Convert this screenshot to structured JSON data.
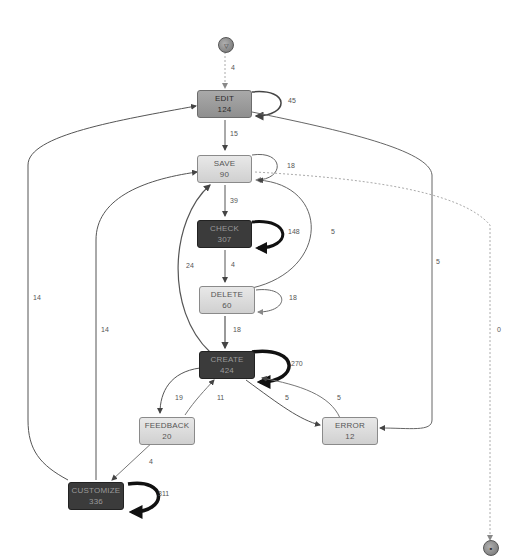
{
  "diagram": {
    "type": "process-map",
    "start": {
      "symbol": "▽"
    },
    "end": {
      "symbol": "■"
    },
    "nodes": [
      {
        "id": "edit",
        "label": "EDIT",
        "count": "124",
        "shade": "mid"
      },
      {
        "id": "save",
        "label": "SAVE",
        "count": "90",
        "shade": "light"
      },
      {
        "id": "check",
        "label": "CHECK",
        "count": "307",
        "shade": "dark"
      },
      {
        "id": "delete",
        "label": "DELETE",
        "count": "60",
        "shade": "light"
      },
      {
        "id": "create",
        "label": "CREATE",
        "count": "424",
        "shade": "dark"
      },
      {
        "id": "feedback",
        "label": "FEEDBACK",
        "count": "20",
        "shade": "light"
      },
      {
        "id": "error",
        "label": "ERROR",
        "count": "12",
        "shade": "light"
      },
      {
        "id": "customize",
        "label": "CUSTOMIZE",
        "count": "336",
        "shade": "dark"
      }
    ],
    "edges": [
      {
        "from": "start",
        "to": "edit",
        "label": "4",
        "style": "dashed"
      },
      {
        "from": "edit",
        "to": "edit",
        "label": "45"
      },
      {
        "from": "edit",
        "to": "save",
        "label": "15"
      },
      {
        "from": "edit",
        "to": "error",
        "label": "5"
      },
      {
        "from": "save",
        "to": "save",
        "label": "18"
      },
      {
        "from": "save",
        "to": "check",
        "label": "39"
      },
      {
        "from": "save",
        "to": "end",
        "label": "0",
        "style": "dashed"
      },
      {
        "from": "check",
        "to": "check",
        "label": "148"
      },
      {
        "from": "check",
        "to": "delete",
        "label": "4"
      },
      {
        "from": "delete",
        "to": "save",
        "label": "5"
      },
      {
        "from": "delete",
        "to": "delete",
        "label": "18"
      },
      {
        "from": "delete",
        "to": "create",
        "label": "18"
      },
      {
        "from": "create",
        "to": "save",
        "label": "24"
      },
      {
        "from": "create",
        "to": "create",
        "label": "270"
      },
      {
        "from": "create",
        "to": "feedback",
        "label": "19"
      },
      {
        "from": "feedback",
        "to": "create",
        "label": "11"
      },
      {
        "from": "create",
        "to": "error",
        "label": "5"
      },
      {
        "from": "error",
        "to": "create",
        "label": "5"
      },
      {
        "from": "feedback",
        "to": "customize",
        "label": "4"
      },
      {
        "from": "customize",
        "to": "edit",
        "label": "14"
      },
      {
        "from": "customize",
        "to": "save",
        "label": "14"
      },
      {
        "from": "customize",
        "to": "customize",
        "label": "311"
      }
    ]
  }
}
